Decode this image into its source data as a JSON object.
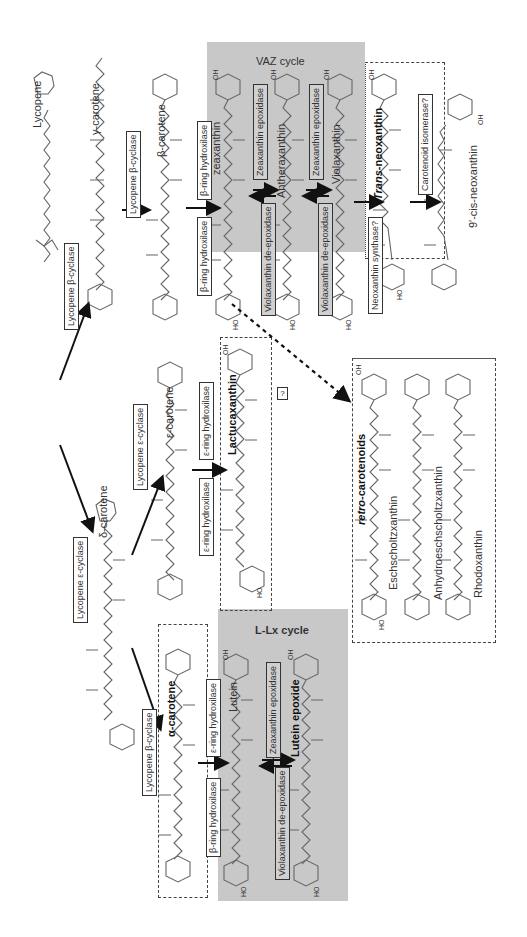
{
  "diagram": {
    "orientation": "rotated 90 degrees counter-clockwise",
    "compounds": {
      "lycopene": "Lycopene",
      "gamma_carotene": "γ-carotene",
      "beta_carotene": "β-carotene",
      "delta_carotene": "δ-carotene",
      "epsilon_carotene": "ε-carotene",
      "alpha_carotene": "α-carotene",
      "zeaxanthin": "zeaxanthin",
      "antheraxanthin": "Antheraxanthin",
      "violaxanthin": "Violaxanthin",
      "trans_neoxanthin_prefix": "Trans",
      "trans_neoxanthin_suffix": "-neoxanthin",
      "cis_neoxanthin": "9′-cis-neoxanthin",
      "lactucaxanthin": "Lactucaxanthin",
      "lutein": "Lutein",
      "lutein_epoxide": "Lutein epoxide",
      "eschscholtzxanthin": "Eschscholtzxanthin",
      "anhydroeschscholtzxanthin": "Anhydroeschscholtzxanthin",
      "rhodoxanthin": "Rhodoxanthin"
    },
    "enzymes": {
      "lyc_beta_cyclase_top": "Lycopene β-cyclase",
      "lyc_beta_cyclase_gamma": "Lycopene β-cyclase",
      "lyc_epsilon_cyclase_delta": "Lycopene ε-cyclase",
      "lyc_epsilon_cyclase_eps": "Lycopene ε-cyclase",
      "lyc_beta_cyclase_alpha": "Lycopene β-cyclase",
      "beta_ring_hydrox_a": "β-ring hydroxilase",
      "beta_ring_hydrox_b": "β-ring hydroxilase",
      "eps_ring_hydrox_a": "ε-ring hydroxilase",
      "eps_ring_hydrox_b": "ε-ring hydroxilase",
      "eps_ring_hydrox_lutein": "ε-ring hydroxilase",
      "beta_ring_hydrox_lutein": "β-ring hydroxilase",
      "zea_epox_1": "Zeaxanthin epoxidase",
      "zea_epox_2": "Zeaxanthin epoxidase",
      "vio_deepox_1": "Violaxanthin de-epoxidase",
      "vio_deepox_2": "Violaxanthin de-epoxidase",
      "neoxanthin_synthase": "Neoxanthin synthase?",
      "carotenoid_isomerase": "Carotenoid isomerase?",
      "zea_epox_lx": "Zeaxanthin epoxidase",
      "vio_deepox_lx": "Violaxanthin de-epoxidase"
    },
    "groups": {
      "vaz_cycle": "VAZ cycle",
      "llx_cycle": "L-Lx cycle",
      "retro_prefix": "retro",
      "retro_suffix": "-carotenoids",
      "unknown_step": "?"
    },
    "substituents": {
      "oh": "OH",
      "ho": "HO",
      "o": "O"
    },
    "colors": {
      "cycle_shade": "#c8c8c8",
      "line": "#666666",
      "arrow": "#111111"
    }
  }
}
